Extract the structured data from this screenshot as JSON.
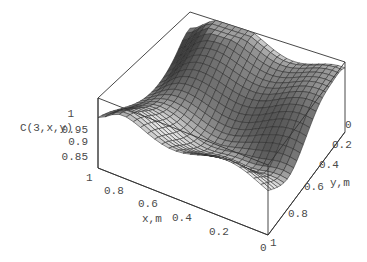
{
  "chart_data": {
    "type": "surface3d",
    "title": "",
    "xlabel": "x,m",
    "ylabel": "y,m",
    "zlabel": "C(3,x,y)",
    "x_ticks": [
      "0",
      "0.2",
      "0.4",
      "0.6",
      "0.8",
      "1"
    ],
    "y_ticks": [
      "0",
      "0.2",
      "0.4",
      "0.6",
      "0.8",
      "1"
    ],
    "z_ticks": [
      "0.85",
      "0.9",
      "0.95",
      "1"
    ],
    "xlim": [
      0,
      1
    ],
    "ylim": [
      0,
      1
    ],
    "zlim": [
      0.82,
      1.0
    ],
    "grid_resolution": 24,
    "surface_description": "Wavy surface with values mostly between ~0.85 and 1.0; ridges run along x, dips near x=1 front edge and near x≈0.2, y≈0.7",
    "colors": {
      "face_light": "#d8d8d8",
      "face_mid": "#a8a8a8",
      "face_dark": "#555555",
      "mesh": "#2a2a2a",
      "box": "#333333"
    }
  }
}
